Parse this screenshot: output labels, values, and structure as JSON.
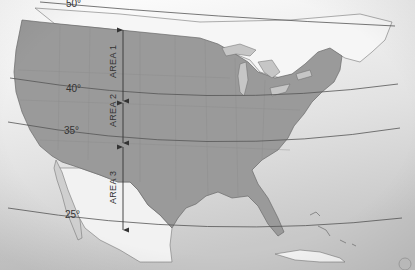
{
  "map": {
    "title": "",
    "colors": {
      "ocean_top": "#ffffff",
      "ocean_bottom": "#cfcfcf",
      "usa_fill": "#9a9a9a",
      "foreign_land": "#f4f4f4",
      "lines": "#555555",
      "lakes": "#c4c4c4"
    },
    "latitudes": [
      {
        "label": "50°",
        "value": 50
      },
      {
        "label": "40°",
        "value": 40
      },
      {
        "label": "35°",
        "value": 35
      },
      {
        "label": "25°",
        "value": 25
      }
    ],
    "areas": [
      {
        "label": "AREA 1",
        "from": "50°",
        "to": "40°"
      },
      {
        "label": "AREA 2",
        "from": "40°",
        "to": "35°"
      },
      {
        "label": "AREA 3",
        "from": "35°",
        "to": "25°"
      }
    ]
  }
}
